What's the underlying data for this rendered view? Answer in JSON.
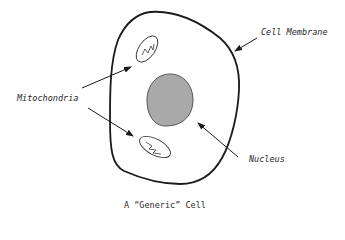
{
  "diagram": {
    "title": "A “Generic” Cell",
    "labels": {
      "membrane": "Cell Membrane",
      "mitochondria": "Mitochondria",
      "nucleus": "Nucleus"
    },
    "colors": {
      "outline": "#1a1a1a",
      "nucleus_fill": "#a9a9a9",
      "nucleus_stroke": "#555555",
      "background": "#ffffff"
    },
    "components": [
      {
        "name": "Cell Membrane",
        "shape": "rounded irregular outline"
      },
      {
        "name": "Mitochondria",
        "count": 2,
        "shape": "ellipse with zigzag"
      },
      {
        "name": "Nucleus",
        "shape": "gray filled oval"
      }
    ]
  }
}
